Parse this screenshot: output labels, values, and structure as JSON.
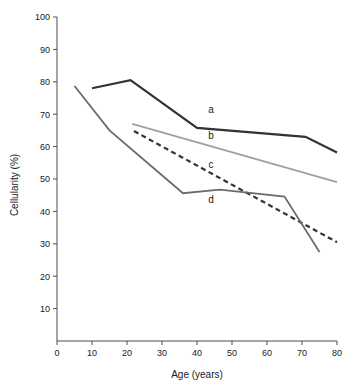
{
  "chart_data": {
    "type": "line",
    "title": "",
    "xlabel": "Age (years)",
    "ylabel": "Cellularity (%)",
    "xlim": [
      0,
      80
    ],
    "ylim": [
      0,
      100
    ],
    "xticks": [
      0,
      10,
      20,
      30,
      40,
      50,
      60,
      70,
      80
    ],
    "yticks": [
      10,
      20,
      30,
      40,
      50,
      60,
      70,
      80,
      90,
      100
    ],
    "grid": false,
    "legend_position": "inline-labels",
    "series": [
      {
        "name": "a",
        "label": "a",
        "color": "#333333",
        "style": "solid",
        "width": 2.2,
        "x": [
          10,
          21,
          40,
          71,
          80
        ],
        "values": [
          78,
          80.5,
          65.8,
          63,
          58.2
        ]
      },
      {
        "name": "b",
        "label": "b",
        "color": "#a0a0a0",
        "style": "solid",
        "width": 1.8,
        "x": [
          21.5,
          80
        ],
        "values": [
          67,
          49
        ]
      },
      {
        "name": "c",
        "label": "c",
        "color": "#333333",
        "style": "dashed",
        "width": 2.2,
        "x": [
          22,
          80
        ],
        "values": [
          64.8,
          30.5
        ]
      },
      {
        "name": "d",
        "label": "d",
        "color": "#6b6b6b",
        "style": "solid",
        "width": 1.8,
        "x": [
          5,
          15,
          36,
          46.5,
          65,
          75
        ],
        "values": [
          78.7,
          65,
          45.6,
          46.7,
          44.6,
          27.5
        ]
      }
    ],
    "annotations": [
      {
        "text": "a",
        "x": 44,
        "y": 70.5
      },
      {
        "text": "b",
        "x": 44,
        "y": 62.5
      },
      {
        "text": "c",
        "x": 44,
        "y": 53.5
      },
      {
        "text": "d",
        "x": 44,
        "y": 42.5
      }
    ]
  }
}
